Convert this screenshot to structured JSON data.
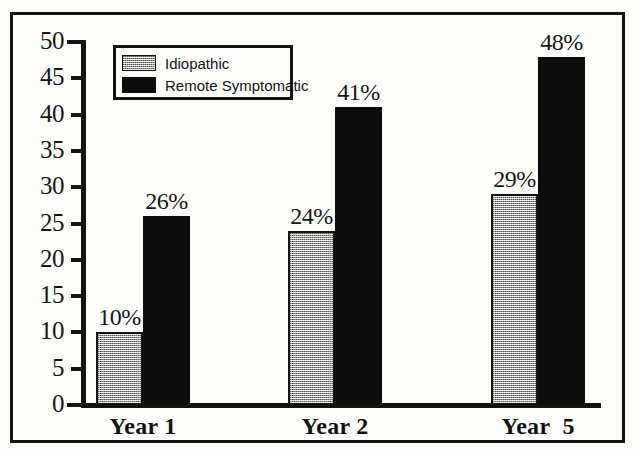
{
  "chart_data": {
    "type": "bar",
    "title": "",
    "subtitle": "",
    "xlabel": "",
    "ylabel": "",
    "categories": [
      "Year 1",
      "Year 2",
      "Year  5"
    ],
    "series": [
      {
        "name": "Idiopathic",
        "color": "#9c9c9c",
        "fill": "gray-halftone",
        "values": [
          10,
          24,
          29
        ],
        "labels": [
          "10%",
          "24%",
          "29%"
        ]
      },
      {
        "name": "Remote Symptomatic",
        "color": "#0d0d0d",
        "fill": "solid-black",
        "values": [
          26,
          41,
          48
        ],
        "labels": [
          "26%",
          "41%",
          "48%"
        ]
      }
    ],
    "ylim": [
      0,
      50
    ],
    "yticks": [
      0,
      5,
      10,
      15,
      20,
      25,
      30,
      35,
      40,
      45,
      50
    ],
    "ytick_labels": [
      "0",
      "5",
      "10",
      "15",
      "20",
      "25",
      "30",
      "35",
      "40",
      "45",
      "50"
    ],
    "grid": false,
    "legend_position": "top-left-inside",
    "value_labels_shown": true
  },
  "legend": {
    "items": [
      {
        "label": "Idiopathic",
        "swatch": "gray-halftone-swatch"
      },
      {
        "label": "Remote Symptomatic",
        "swatch": "black-swatch"
      }
    ]
  },
  "colors": {
    "frame": "#141414",
    "axis": "#141414",
    "idiopathic": "#9c9c9c",
    "remote_symptomatic": "#0d0d0d",
    "background": "#fdfdfc",
    "text": "#171717"
  }
}
